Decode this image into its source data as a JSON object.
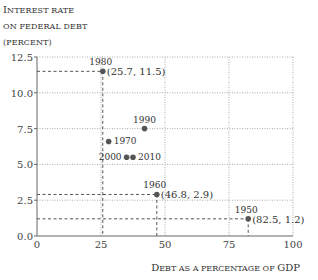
{
  "chart_data": {
    "type": "scatter",
    "title": "",
    "ylabel_lines": [
      "Interest rate",
      "on federal debt",
      "(percent)"
    ],
    "xlabel": "Debt as a percentage of GDP",
    "xlim": [
      0,
      100
    ],
    "ylim": [
      0,
      12.5
    ],
    "xticks": [
      "0",
      "25",
      "50",
      "75",
      "100"
    ],
    "yticks": [
      "0.0",
      "2.5",
      "5.0",
      "7.5",
      "10.0",
      "12.5"
    ],
    "grid": true,
    "points": [
      {
        "label": "1950",
        "x": 82.5,
        "y": 1.2,
        "annotation": "(82.5, 1.2)"
      },
      {
        "label": "1960",
        "x": 46.8,
        "y": 2.9,
        "annotation": "(46.8, 2.9)"
      },
      {
        "label": "1970",
        "x": 28.0,
        "y": 6.6
      },
      {
        "label": "1980",
        "x": 25.7,
        "y": 11.5,
        "annotation": "(25.7, 11.5)"
      },
      {
        "label": "1990",
        "x": 42.0,
        "y": 7.5
      },
      {
        "label": "2000",
        "x": 35.0,
        "y": 5.5
      },
      {
        "label": "2010",
        "x": 37.5,
        "y": 5.5
      }
    ]
  },
  "labels": {
    "y1": "Interest rate",
    "y2": "on federal debt",
    "y3": "(percent)",
    "x": "Debt as a percentage of GDP"
  }
}
